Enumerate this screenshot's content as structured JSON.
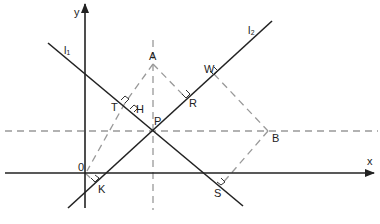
{
  "diagram": {
    "type": "coordinate-geometry-figure",
    "axes": {
      "x_label": "x",
      "y_label": "y",
      "origin_label": "0"
    },
    "lines": [
      {
        "name": "l1",
        "label": "l₁"
      },
      {
        "name": "l2",
        "label": "l₂"
      }
    ],
    "points": {
      "A": "A",
      "B": "B",
      "P": "P",
      "O": "0",
      "T": "T",
      "H": "H",
      "R": "R",
      "W": "W",
      "K": "K",
      "S": "S"
    },
    "colors": {
      "solid": "#222222",
      "dashed": "#999999",
      "background": "#ffffff"
    }
  }
}
